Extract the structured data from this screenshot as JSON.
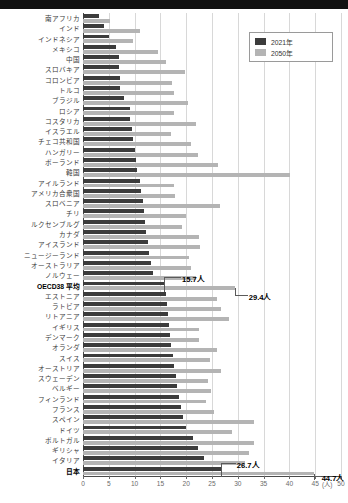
{
  "chart_data": {
    "type": "bar",
    "orientation": "horizontal",
    "title": "",
    "xlabel": "(人)",
    "ylabel": "",
    "xlim": [
      0,
      50
    ],
    "xticks": [
      "0",
      "5",
      "10",
      "15",
      "20",
      "25",
      "30",
      "35",
      "40",
      "45",
      "50"
    ],
    "grid": true,
    "legend_position": "top-right",
    "legend": [
      {
        "name": "2021年",
        "color": "#3c3c3c"
      },
      {
        "name": "2050年",
        "color": "#b4b4b4"
      }
    ],
    "series": [
      {
        "name": "2021年",
        "color": "#3c3c3c"
      },
      {
        "name": "2050年",
        "color": "#b4b4b4"
      }
    ],
    "categories": [
      "南アフリカ",
      "インド",
      "インドネシア",
      "メキシコ",
      "中国",
      "スロバキア",
      "コロンビア",
      "トルコ",
      "ブラジル",
      "ロシア",
      "コスタリカ",
      "イスラエル",
      "チェコ共和国",
      "ハンガリー",
      "ポーランド",
      "韓国",
      "アイルランド",
      "アメリカ合衆国",
      "スロベニア",
      "チリ",
      "ルクセンブルグ",
      "カナダ",
      "アイスランド",
      "ニュージーランド",
      "オーストラリア",
      "ノルウェー",
      "OECD38 平均",
      "エストニア",
      "ラトビア",
      "リトアニア",
      "イギリス",
      "デンマーク",
      "オランダ",
      "スイス",
      "オーストリア",
      "スウェーデン",
      "ベルギー",
      "フィンランド",
      "フランス",
      "スペイン",
      "ドイツ",
      "ポルトガル",
      "ギリシャ",
      "イタリア",
      "日本"
    ],
    "values_2021": [
      3.1,
      4.0,
      5.0,
      6.4,
      6.9,
      7.0,
      7.1,
      7.2,
      8.0,
      9.1,
      9.2,
      9.5,
      9.7,
      10.0,
      10.2,
      10.5,
      11.1,
      11.3,
      11.6,
      11.8,
      12.0,
      12.3,
      12.6,
      12.8,
      13.1,
      13.5,
      15.7,
      16.0,
      16.2,
      16.4,
      16.7,
      16.9,
      17.1,
      17.4,
      17.7,
      18.0,
      18.2,
      18.6,
      18.9,
      19.3,
      20.0,
      21.4,
      22.3,
      23.5,
      26.7
    ],
    "values_2050": [
      5.2,
      11.0,
      9.6,
      14.6,
      16.1,
      19.8,
      17.3,
      17.6,
      20.4,
      17.6,
      21.9,
      17.0,
      21.0,
      22.3,
      26.1,
      40.1,
      17.6,
      17.9,
      26.5,
      20.0,
      19.1,
      22.5,
      22.7,
      20.6,
      21.0,
      21.9,
      29.4,
      25.9,
      26.8,
      28.2,
      22.5,
      22.5,
      25.9,
      24.6,
      26.7,
      24.2,
      24.9,
      23.8,
      25.3,
      33.1,
      28.8,
      33.2,
      32.2,
      31.4,
      44.7
    ],
    "annotations": [
      {
        "label": "15.7人",
        "series": "2021年",
        "category": "OECD38 平均",
        "value": 15.7
      },
      {
        "label": "29.4人",
        "series": "2050年",
        "category": "OECD38 平均",
        "value": 29.4
      },
      {
        "label": "26.7人",
        "series": "2021年",
        "category": "日本",
        "value": 26.7
      },
      {
        "label": "44.7人",
        "series": "2050年",
        "category": "日本",
        "value": 44.7
      }
    ],
    "highlighted_categories": [
      "OECD38 平均",
      "日本"
    ]
  }
}
